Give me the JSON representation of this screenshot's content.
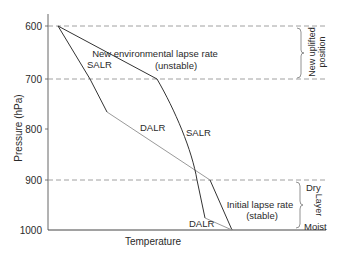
{
  "diagram": {
    "y_axis": {
      "label": "Pressure (hPa)",
      "ticks": [
        "600",
        "700",
        "800",
        "900",
        "1000"
      ]
    },
    "x_axis": {
      "label": "Temperature"
    },
    "labels": {
      "new_env": "New environmental lapse rate",
      "new_env_sub": "(unstable)",
      "salr_upper_left": "SALR",
      "dalr_middle": "DALR",
      "salr_right": "SALR",
      "dalr_bottom": "DALR",
      "initial": "Initial lapse rate",
      "initial_sub": "(stable)"
    },
    "brackets": {
      "upper": {
        "line1": "New uplifted",
        "line2": "position"
      },
      "lower": {
        "top": "Dry",
        "middle": "Layer",
        "bottom": "Moist"
      }
    },
    "colors": {
      "line_dark": "#333333",
      "line_light": "#9a9a9a",
      "dashed": "#888888",
      "axis": "#555555"
    }
  }
}
